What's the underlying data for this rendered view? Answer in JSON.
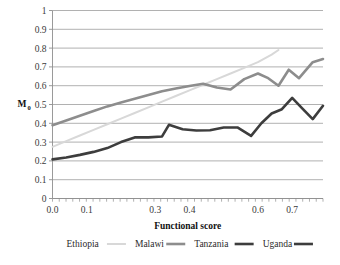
{
  "chart_data": {
    "type": "line",
    "title": "",
    "xlabel": "Functional score",
    "ylabel": "M0",
    "ylabel_base": "M",
    "ylabel_sub": "0",
    "ylim": [
      0,
      1
    ],
    "xlim": [
      0,
      0.79
    ],
    "grid": "horizontal",
    "legend_position": "bottom",
    "y_ticks": [
      "0",
      "0.1",
      "0.2",
      "0.3",
      "0.4",
      "0.5",
      "0.6",
      "0.7",
      "0.8",
      "0.9",
      "1"
    ],
    "y_tick_values": [
      0,
      0.1,
      0.2,
      0.3,
      0.4,
      0.5,
      0.6,
      0.7,
      0.8,
      0.9,
      1
    ],
    "x_ticks": [
      "0.0",
      "0.1",
      "0.3",
      "0.4",
      "0.6",
      "0.7"
    ],
    "x_tick_values": [
      0.0,
      0.1,
      0.3,
      0.4,
      0.6,
      0.7
    ],
    "series": [
      {
        "name": "Ethiopia",
        "color": "#d8d8d8",
        "width": 2.0,
        "x": [
          0.0,
          0.04,
          0.08,
          0.12,
          0.16,
          0.2,
          0.24,
          0.28,
          0.32,
          0.36,
          0.4,
          0.44,
          0.48,
          0.52,
          0.56,
          0.6,
          0.64,
          0.66
        ],
        "y": [
          0.275,
          0.305,
          0.335,
          0.365,
          0.395,
          0.425,
          0.455,
          0.485,
          0.515,
          0.545,
          0.575,
          0.605,
          0.635,
          0.665,
          0.695,
          0.725,
          0.765,
          0.79
        ]
      },
      {
        "name": "Malawi",
        "color": "#8d8d8d",
        "width": 2.6,
        "x": [
          0.0,
          0.04,
          0.08,
          0.12,
          0.16,
          0.2,
          0.24,
          0.28,
          0.32,
          0.36,
          0.4,
          0.44,
          0.48,
          0.52,
          0.56,
          0.6,
          0.63,
          0.66,
          0.69,
          0.72,
          0.76,
          0.79
        ],
        "y": [
          0.39,
          0.415,
          0.44,
          0.465,
          0.49,
          0.51,
          0.53,
          0.55,
          0.57,
          0.585,
          0.598,
          0.61,
          0.59,
          0.58,
          0.635,
          0.665,
          0.64,
          0.6,
          0.685,
          0.64,
          0.725,
          0.742
        ]
      },
      {
        "name": "Tanzania",
        "color": "#3d3d3d",
        "width": 1.4,
        "x": [],
        "y": []
      },
      {
        "name": "Uganda",
        "color": "#3d3d3d",
        "width": 2.6,
        "x": [
          0.0,
          0.04,
          0.08,
          0.12,
          0.16,
          0.2,
          0.24,
          0.28,
          0.32,
          0.34,
          0.38,
          0.42,
          0.46,
          0.5,
          0.54,
          0.58,
          0.61,
          0.64,
          0.67,
          0.7,
          0.73,
          0.76,
          0.79
        ],
        "y": [
          0.208,
          0.218,
          0.232,
          0.248,
          0.268,
          0.3,
          0.325,
          0.325,
          0.33,
          0.392,
          0.368,
          0.362,
          0.363,
          0.378,
          0.378,
          0.333,
          0.4,
          0.452,
          0.475,
          0.535,
          0.478,
          0.422,
          0.493
        ]
      }
    ],
    "legend": [
      {
        "label": "Ethiopia",
        "color": "#d8d8d8",
        "width": 2.0
      },
      {
        "label": "Malawi",
        "color": "#8d8d8d",
        "width": 2.6
      },
      {
        "label": "Tanzania",
        "color": "#3d3d3d",
        "width": 2.6
      },
      {
        "label": "Uganda",
        "color": "#3d3d3d",
        "width": 2.6
      }
    ],
    "colors": {
      "gridline": "#8f8f8f",
      "axis": "#8f8f8f",
      "text": "#3a3a3a",
      "background": "#ffffff"
    }
  }
}
